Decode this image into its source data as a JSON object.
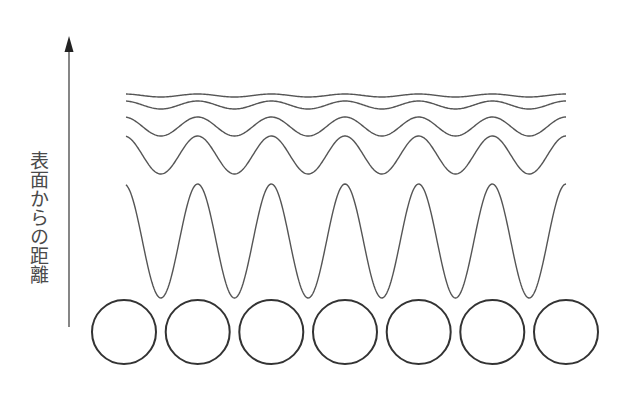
{
  "diagram": {
    "axis_label": "表面からの距離",
    "axis_direction": "up",
    "colors": {
      "background": "#ffffff",
      "wave_stroke": "#555555",
      "circle_stroke": "#333333",
      "arrow": "#444444",
      "text": "#4a4a4a"
    },
    "arrow": {
      "x": 69,
      "y_top": 36,
      "y_bottom": 327,
      "head_length": 16,
      "head_half_width": 4.5
    },
    "surface_atoms": {
      "count": 7,
      "centers_x": [
        124,
        197.7,
        271.3,
        345,
        418.7,
        492.3,
        566
      ],
      "center_y": 332,
      "radius": 32
    },
    "waves": [
      {
        "name": "wave-1",
        "center_y": 95.5,
        "amplitude": 1.5
      },
      {
        "name": "wave-2",
        "center_y": 105,
        "amplitude": 4
      },
      {
        "name": "wave-3",
        "center_y": 126.5,
        "amplitude": 9.5
      },
      {
        "name": "wave-4",
        "center_y": 155,
        "amplitude": 19
      },
      {
        "name": "wave-5",
        "center_y": 241,
        "amplitude": 57
      }
    ],
    "wave_x_start": 126,
    "wave_x_end": 566,
    "wave_period": 73.67,
    "wave_phase_origin_x": 124
  }
}
